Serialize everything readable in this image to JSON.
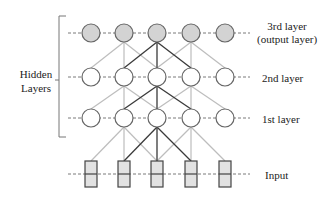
{
  "diagram": {
    "bracket_label": [
      "Hidden",
      "Layers"
    ],
    "layers": [
      {
        "id": "layer3",
        "label": "3rd layer",
        "sublabel": "(output layer)",
        "y": 33,
        "fill": "#d3d3d3",
        "shape": "circle"
      },
      {
        "id": "layer2",
        "label": "2nd layer",
        "sublabel": "",
        "y": 77,
        "fill": "#ffffff",
        "shape": "circle"
      },
      {
        "id": "layer1",
        "label": "1st layer",
        "sublabel": "",
        "y": 118,
        "fill": "#ffffff",
        "shape": "circle"
      },
      {
        "id": "input",
        "label": "Input",
        "sublabel": "",
        "y": 174,
        "fill": "#e2e2e2",
        "shape": "box"
      }
    ],
    "node_x": [
      91,
      124,
      157,
      191,
      225
    ],
    "nodes_per_layer": 5,
    "connection_rule": "nodes 2-4 connect to i-1, i, i+1 in layer below",
    "highlight_node_index": 2,
    "colors": {
      "edge_light": "#bdbdbd",
      "edge_dark": "#3a3a3a",
      "node_stroke": "#666666",
      "dash": "#7a7a7a",
      "bracket": "#777777"
    }
  }
}
